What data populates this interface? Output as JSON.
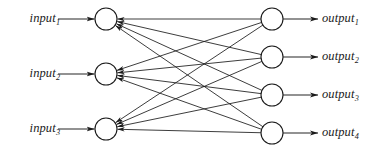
{
  "diagram": {
    "type": "neural-network",
    "title": "",
    "stroke_color": "#1a1a1a",
    "node_fill": "#ffffff",
    "background": "#ffffff",
    "layers": [
      {
        "name": "input-layer",
        "node_count": 3,
        "node_radius": 11,
        "center_x": 106,
        "node_y": [
          19,
          74,
          129
        ],
        "labels": [
          {
            "base": "input",
            "sub": "1"
          },
          {
            "base": "input",
            "sub": "2"
          },
          {
            "base": "input",
            "sub": "3"
          }
        ]
      },
      {
        "name": "output-layer",
        "node_count": 4,
        "node_radius": 11,
        "center_x": 272,
        "node_y": [
          19,
          57,
          95,
          133
        ],
        "labels": [
          {
            "base": "output",
            "sub": "1"
          },
          {
            "base": "output",
            "sub": "2"
          },
          {
            "base": "output",
            "sub": "3"
          },
          {
            "base": "output",
            "sub": "4"
          }
        ]
      }
    ],
    "edges": {
      "count": 12,
      "direction": "output-to-input",
      "pairs": [
        [
          0,
          0
        ],
        [
          0,
          1
        ],
        [
          0,
          2
        ],
        [
          0,
          3
        ],
        [
          1,
          0
        ],
        [
          1,
          1
        ],
        [
          1,
          2
        ],
        [
          1,
          3
        ],
        [
          2,
          0
        ],
        [
          2,
          1
        ],
        [
          2,
          2
        ],
        [
          2,
          3
        ]
      ]
    },
    "input_arrows": {
      "count": 3,
      "x_start": 58,
      "x_end": 95,
      "direction": "rightward"
    },
    "output_arrows": {
      "count": 4,
      "x_start": 283,
      "x_end": 318,
      "direction": "rightward"
    }
  }
}
